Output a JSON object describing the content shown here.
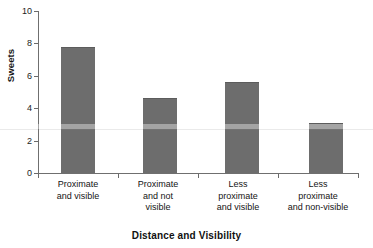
{
  "chart_data": {
    "type": "bar",
    "title": "",
    "xlabel": "Distance and Visibility",
    "ylabel": "Sweets",
    "categories": [
      "Proximate and visible",
      "Proximate and not visible",
      "Less proximate and visible",
      "Less proximate and non-visible"
    ],
    "category_lines": [
      [
        "Proximate",
        "and visible"
      ],
      [
        "Proximate",
        "and not",
        "visible"
      ],
      [
        "Less",
        "proximate",
        "and visible"
      ],
      [
        "Less",
        "proximate",
        "and non-visible"
      ]
    ],
    "values": [
      7.8,
      4.65,
      5.6,
      3.1
    ],
    "ylim": [
      0,
      10
    ],
    "yticks": [
      0,
      2,
      4,
      6,
      8,
      10
    ],
    "ytick_labels": [
      "0",
      "2",
      "4",
      "6",
      "8",
      "10"
    ],
    "grid": false,
    "legend": false,
    "bar_color": "#6d6d6d",
    "axis_color": "#6f6f6f"
  },
  "axis": {
    "y_title": "Sweets",
    "x_title": "Distance and Visibility"
  },
  "ticks": {
    "t0": "0",
    "t1": "2",
    "t2": "4",
    "t3": "6",
    "t4": "8",
    "t5": "10"
  },
  "categories": {
    "c0l0": "Proximate",
    "c0l1": "and visible",
    "c1l0": "Proximate",
    "c1l1": "and not",
    "c1l2": "visible",
    "c2l0": "Less",
    "c2l1": "proximate",
    "c2l2": "and visible",
    "c3l0": "Less",
    "c3l1": "proximate",
    "c3l2": "and non-visible"
  }
}
